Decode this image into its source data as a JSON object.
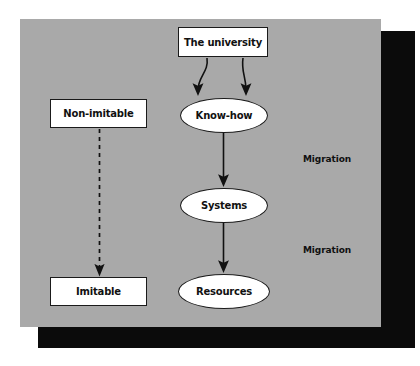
{
  "figure": {
    "panel_color": "#a9a9a9",
    "shadow_color": "#0b0b0b",
    "node_fill": "#ffffff",
    "stroke_color": "#1a1a1a"
  },
  "nodes": {
    "university": {
      "label": "The university",
      "shape": "rectangle"
    },
    "knowhow": {
      "label": "Know-how",
      "shape": "ellipse"
    },
    "systems": {
      "label": "Systems",
      "shape": "ellipse"
    },
    "resources": {
      "label": "Resources",
      "shape": "ellipse"
    },
    "nonimitable": {
      "label": "Non-imitable",
      "shape": "rectangle"
    },
    "imitable": {
      "label": "Imitable",
      "shape": "rectangle"
    }
  },
  "annotations": {
    "migration_1": "Migration",
    "migration_2": "Migration"
  },
  "edges": [
    {
      "from": "university",
      "to": "knowhow",
      "style": "curved-solid"
    },
    {
      "from": "university",
      "to": "knowhow",
      "style": "curved-solid"
    },
    {
      "from": "knowhow",
      "to": "systems",
      "style": "straight-solid"
    },
    {
      "from": "systems",
      "to": "resources",
      "style": "straight-solid"
    },
    {
      "from": "nonimitable",
      "to": "imitable",
      "style": "straight-dashed"
    }
  ]
}
